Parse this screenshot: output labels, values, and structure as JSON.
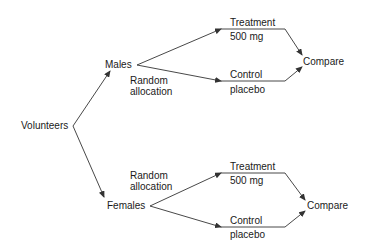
{
  "diagram": {
    "root": {
      "label": "Volunteers"
    },
    "groups": [
      {
        "label": "Males",
        "allocation": [
          "Random",
          "allocation"
        ],
        "arms": [
          {
            "name": "Treatment",
            "detail": "500 mg"
          },
          {
            "name": "Control",
            "detail": "placebo"
          }
        ],
        "outcome": "Compare"
      },
      {
        "label": "Females",
        "allocation": [
          "Random",
          "allocation"
        ],
        "arms": [
          {
            "name": "Treatment",
            "detail": "500 mg"
          },
          {
            "name": "Control",
            "detail": "placebo"
          }
        ],
        "outcome": "Compare"
      }
    ],
    "colors": {
      "line": "#333333",
      "text": "#1a1a1a",
      "background": "#ffffff"
    }
  }
}
